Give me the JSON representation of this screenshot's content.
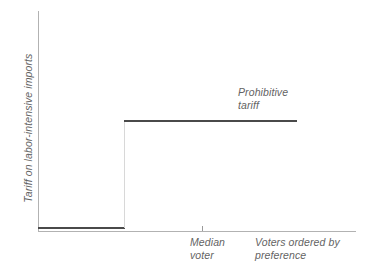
{
  "chart_data": {
    "type": "line",
    "title": "",
    "subtitle": "",
    "xlabel": "Voters ordered by preference",
    "ylabel": "Tariff on labor-intensive imports",
    "xlim": [
      0,
      100
    ],
    "ylim": [
      0,
      100
    ],
    "grid": false,
    "legend": null,
    "axis_ticks": {
      "x": [
        {
          "value": 51,
          "label": "Median voter"
        }
      ],
      "y": []
    },
    "series": [
      {
        "name": "Tariff schedule",
        "style": "step",
        "x": [
          0,
          27,
          27,
          81
        ],
        "values": [
          2,
          2,
          48,
          48
        ]
      }
    ],
    "annotations": [
      {
        "name": "prohibitive-tariff",
        "text": "Prohibitive\ntariff",
        "x": 63,
        "y": 62
      }
    ]
  },
  "labels": {
    "y_axis": "Tariff on labor-intensive imports",
    "prohibitive_tariff": "Prohibitive\ntariff",
    "median_voter": "Median\nvoter",
    "voters_ordered": "Voters ordered by\npreference"
  },
  "colors": {
    "data_line": "#4a4a4a",
    "riser_line": "#d8d8d8",
    "axis": "#b2b2b2",
    "text": "#636363",
    "background": "#ffffff"
  }
}
